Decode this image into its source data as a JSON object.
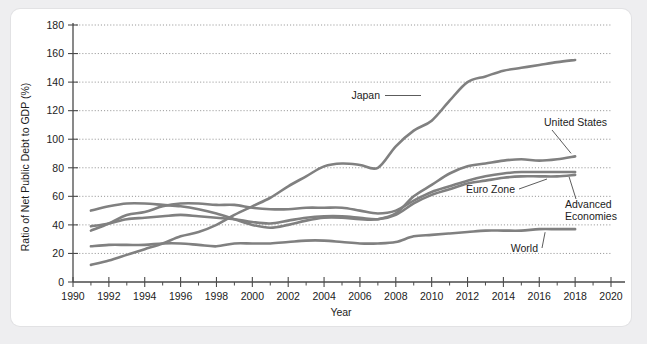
{
  "chart_data": {
    "type": "line",
    "title": "",
    "xlabel": "Year",
    "ylabel": "Ratio of Net Public Debt to GDP (%)",
    "xlim": [
      1990,
      2020
    ],
    "ylim": [
      0,
      180
    ],
    "y_ticks": [
      0,
      20,
      40,
      60,
      80,
      100,
      120,
      140,
      160,
      180
    ],
    "x_ticks": [
      1990,
      1992,
      1994,
      1996,
      1998,
      2000,
      2002,
      2004,
      2006,
      2008,
      2010,
      2012,
      2014,
      2016,
      2018,
      2020
    ],
    "x_minor_tick_step": 1,
    "grid": "horizontal-dotted",
    "legend_position": "inline-annotations",
    "line_color": "#808080",
    "x": [
      1991,
      1992,
      1993,
      1994,
      1995,
      1996,
      1997,
      1998,
      1999,
      2000,
      2001,
      2002,
      2003,
      2004,
      2005,
      2006,
      2007,
      2008,
      2009,
      2010,
      2011,
      2012,
      2013,
      2014,
      2015,
      2016,
      2017,
      2018
    ],
    "series": [
      {
        "name": "Japan",
        "label": "Japan",
        "values": [
          12,
          15,
          19,
          23,
          27,
          32,
          35,
          40,
          47,
          53,
          59,
          67,
          74,
          81,
          83,
          82,
          80,
          95,
          106,
          113,
          127,
          140,
          144,
          148,
          150,
          152,
          154,
          155.5
        ]
      },
      {
        "name": "United States",
        "label": "United States",
        "values": [
          50,
          53,
          55,
          55,
          54,
          53,
          51,
          48,
          44,
          40,
          38,
          40,
          43,
          45,
          45,
          44,
          44,
          48,
          60,
          68,
          76,
          81,
          83,
          85,
          86,
          85,
          86,
          88
        ]
      },
      {
        "name": "Euro Zone",
        "label": "Euro Zone",
        "values": [
          36,
          41,
          47,
          49,
          53,
          55,
          55,
          54,
          54,
          52,
          51,
          51,
          52,
          52,
          52,
          50,
          48,
          50,
          57,
          63,
          67,
          71,
          74,
          76,
          77,
          77,
          77,
          77
        ]
      },
      {
        "name": "Advanced Economies",
        "label": "Advanced Economies",
        "values": [
          39,
          41,
          44,
          45,
          46,
          47,
          46,
          45,
          44,
          42,
          41,
          43,
          45,
          46,
          46,
          45,
          44,
          47,
          55,
          61,
          65,
          69,
          71,
          73,
          74,
          74,
          74,
          75
        ]
      },
      {
        "name": "World",
        "label": "World",
        "values": [
          25,
          26,
          26,
          26,
          27,
          27,
          26,
          25,
          27,
          27,
          27,
          28,
          29,
          29,
          28,
          27,
          27,
          28,
          32,
          33,
          34,
          35,
          36,
          36,
          36,
          37,
          37,
          37
        ]
      }
    ],
    "annotations": [
      {
        "text": "Japan",
        "series": "Japan"
      },
      {
        "text": "United States",
        "series": "United States"
      },
      {
        "text": "Euro Zone",
        "series": "Euro Zone"
      },
      {
        "text": "Advanced",
        "series": "Advanced Economies"
      },
      {
        "text": "Economies",
        "series": "Advanced Economies"
      },
      {
        "text": "World",
        "series": "World"
      }
    ]
  },
  "labels": {
    "japan": "Japan",
    "united_states": "United States",
    "euro_zone": "Euro Zone",
    "advanced_1": "Advanced",
    "advanced_2": "Economies",
    "world": "World",
    "x_axis_title": "Year",
    "y_axis_title": "Ratio of Net Public Debt to GDP (%)"
  },
  "y_tick_labels": {
    "t0": "0",
    "t1": "20",
    "t2": "40",
    "t3": "60",
    "t4": "80",
    "t5": "100",
    "t6": "120",
    "t7": "140",
    "t8": "160",
    "t9": "180"
  },
  "x_tick_labels": {
    "t0": "1990",
    "t1": "1992",
    "t2": "1994",
    "t3": "1996",
    "t4": "1998",
    "t5": "2000",
    "t6": "2002",
    "t7": "2004",
    "t8": "2006",
    "t9": "2008",
    "t10": "2010",
    "t11": "2012",
    "t12": "2014",
    "t13": "2016",
    "t14": "2018",
    "t15": "2020"
  }
}
